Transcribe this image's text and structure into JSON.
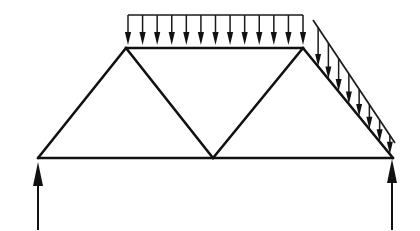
{
  "figure": {
    "caption": "",
    "background_color": "#ffffff",
    "line_color": "#111111",
    "canvas": {
      "width": 420,
      "height": 231
    }
  },
  "chart_data": {
    "type": "diagram",
    "xlabel": "",
    "ylabel": "",
    "units": "pixels",
    "xlim": [
      0,
      420
    ],
    "ylim": [
      0,
      231
    ],
    "grid": false,
    "legend": "none",
    "nodes": [
      {
        "id": "A",
        "label": "left-support-node",
        "x": 38,
        "y": 158
      },
      {
        "id": "B",
        "label": "left-apex-node",
        "x": 126,
        "y": 48
      },
      {
        "id": "C",
        "label": "bottom-center-node",
        "x": 213,
        "y": 158
      },
      {
        "id": "D",
        "label": "right-apex-node",
        "x": 303,
        "y": 48
      },
      {
        "id": "E",
        "label": "right-support-node",
        "x": 393,
        "y": 158
      }
    ],
    "members": [
      {
        "name": "bottom-chord-left",
        "from": "A",
        "to": "C",
        "x1": 38,
        "y1": 158,
        "x2": 213,
        "y2": 158
      },
      {
        "name": "bottom-chord-right",
        "from": "C",
        "to": "E",
        "x1": 213,
        "y1": 158,
        "x2": 393,
        "y2": 158
      },
      {
        "name": "left-inclined-chord",
        "from": "A",
        "to": "B",
        "x1": 38,
        "y1": 158,
        "x2": 126,
        "y2": 48
      },
      {
        "name": "top-chord",
        "from": "B",
        "to": "D",
        "x1": 126,
        "y1": 48,
        "x2": 303,
        "y2": 48
      },
      {
        "name": "web-diagonal-left",
        "from": "B",
        "to": "C",
        "x1": 126,
        "y1": 48,
        "x2": 213,
        "y2": 158
      },
      {
        "name": "web-diagonal-right",
        "from": "C",
        "to": "D",
        "x1": 213,
        "y1": 158,
        "x2": 303,
        "y2": 48
      },
      {
        "name": "right-inclined-chord",
        "from": "D",
        "to": "E",
        "x1": 303,
        "y1": 48,
        "x2": 393,
        "y2": 158
      }
    ],
    "loads": [
      {
        "name": "top-uniform-distributed-load",
        "kind": "uniformly-distributed",
        "direction": "downward",
        "applied_to": "top-chord",
        "arrow_count": 13,
        "rail": {
          "x1": 128,
          "y1": 15,
          "x2": 303,
          "y2": 15
        },
        "arrow_tip_y": 45,
        "arrow_start_x": 128,
        "arrow_end_x": 303
      },
      {
        "name": "right-triangular-distributed-load",
        "kind": "linearly-varying-triangular",
        "direction": "downward",
        "applied_to": "right-inclined-chord",
        "arrow_count": 8,
        "rail": {
          "x1": 313,
          "y1": 20,
          "x2": 395,
          "y2": 143
        },
        "baseline": {
          "x1": 303,
          "y1": 48,
          "x2": 393,
          "y2": 158
        }
      }
    ],
    "reactions": [
      {
        "name": "left-support-reaction",
        "direction": "upward",
        "at_node": "A",
        "x": 38,
        "tail_y": 230,
        "tip_y": 162
      },
      {
        "name": "right-support-reaction",
        "direction": "upward",
        "at_node": "E",
        "x": 392,
        "tail_y": 230,
        "tip_y": 159
      }
    ]
  }
}
